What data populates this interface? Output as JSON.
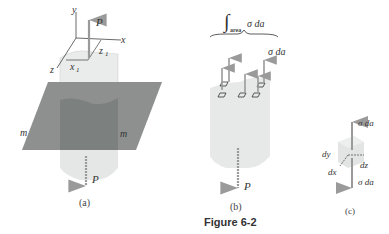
{
  "figure": {
    "caption": "Figure 6-2",
    "panel_a": {
      "label": "(a)",
      "axis_y": "y",
      "axis_x": "x",
      "axis_z": "z",
      "x1": "x",
      "x1_sub": "1",
      "z1": "z",
      "z1_sub": "1",
      "force_top": "P",
      "force_bottom": "P",
      "plane_left": "m",
      "plane_right": "m"
    },
    "panel_b": {
      "label": "(b)",
      "integral_sub": "area",
      "integral_expr": "σ da",
      "element_force": "σ da",
      "force_bottom": "P"
    },
    "panel_c": {
      "label": "(c)",
      "force_top": "σ da",
      "force_bottom": "σ da",
      "dim_y": "dy",
      "dim_x": "dx",
      "dim_z": "dz"
    }
  }
}
